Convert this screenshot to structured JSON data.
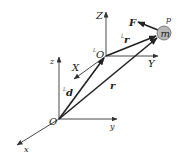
{
  "diagram": {
    "type": "coordinate-frames-vector-diagram",
    "colors": {
      "ink": "#222222",
      "mass_fill": "#b8b8b8",
      "background": "#ffffff"
    },
    "world_frame": {
      "origin_label": "O",
      "axes": {
        "x": "x",
        "y": "y",
        "z": "z"
      }
    },
    "local_frame": {
      "origin_prefix": "L",
      "origin_label": "O",
      "axes": {
        "x": "X",
        "y": "Y",
        "z": "Z"
      }
    },
    "vectors": {
      "d": {
        "prefix": "L",
        "label": "d"
      },
      "r": {
        "label": "r"
      },
      "local_r": {
        "prefix": "L",
        "label": "r"
      },
      "force": {
        "label": "F"
      }
    },
    "particle": {
      "point_label": "p",
      "mass_label": "m"
    }
  }
}
